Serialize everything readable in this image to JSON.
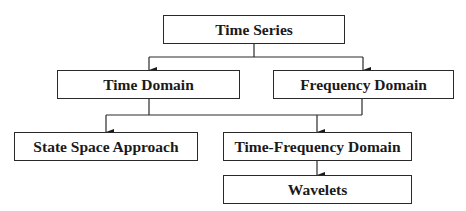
{
  "diagram": {
    "type": "hierarchy",
    "nodes": [
      {
        "id": "time_series",
        "label": "Time Series"
      },
      {
        "id": "time_domain",
        "label": "Time Domain"
      },
      {
        "id": "frequency_domain",
        "label": "Frequency Domain"
      },
      {
        "id": "state_space",
        "label": "State Space Approach"
      },
      {
        "id": "time_frequency",
        "label": "Time-Frequency Domain"
      },
      {
        "id": "wavelets",
        "label": "Wavelets"
      }
    ],
    "edges": [
      {
        "from": "time_series",
        "to": "time_domain"
      },
      {
        "from": "time_series",
        "to": "frequency_domain"
      },
      {
        "from": "time_domain",
        "to": "state_space"
      },
      {
        "from": "time_domain",
        "to": "time_frequency"
      },
      {
        "from": "frequency_domain",
        "to": "state_space"
      },
      {
        "from": "frequency_domain",
        "to": "time_frequency"
      },
      {
        "from": "time_frequency",
        "to": "wavelets"
      }
    ]
  }
}
